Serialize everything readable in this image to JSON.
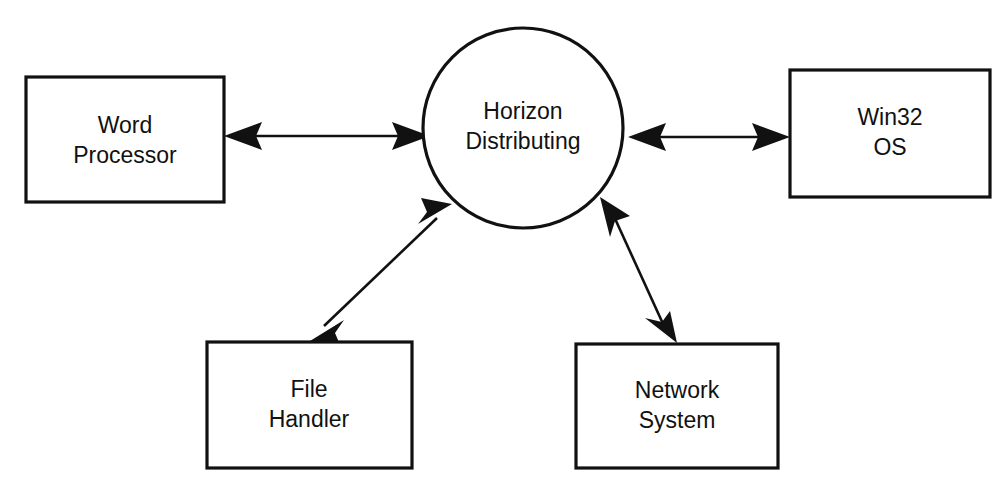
{
  "diagram": {
    "background_color": "#ffffff",
    "stroke_color": "#111111",
    "hub": {
      "name": "horizon-distributing",
      "label_line1": "Horizon",
      "label_line2": "Distributing",
      "shape": "circle"
    },
    "nodes": [
      {
        "name": "word-processor",
        "label_line1": "Word",
        "label_line2": "Processor",
        "shape": "rectangle",
        "position": "left"
      },
      {
        "name": "win32-os",
        "label_line1": "Win32",
        "label_line2": "OS",
        "shape": "rectangle",
        "position": "right"
      },
      {
        "name": "file-handler",
        "label_line1": "File",
        "label_line2": "Handler",
        "shape": "rectangle",
        "position": "bottom-left"
      },
      {
        "name": "network-system",
        "label_line1": "Network",
        "label_line2": "System",
        "shape": "rectangle",
        "position": "bottom-right"
      }
    ],
    "connections": [
      {
        "name": "word-processor-to-hub",
        "from": "word-processor",
        "to": "horizon-distributing",
        "style": "double-headed-arrow"
      },
      {
        "name": "hub-to-win32-os",
        "from": "horizon-distributing",
        "to": "win32-os",
        "style": "double-headed-arrow"
      },
      {
        "name": "hub-to-file-handler",
        "from": "horizon-distributing",
        "to": "file-handler",
        "style": "double-headed-arrow"
      },
      {
        "name": "hub-to-network-system",
        "from": "horizon-distributing",
        "to": "network-system",
        "style": "double-headed-arrow"
      }
    ]
  }
}
